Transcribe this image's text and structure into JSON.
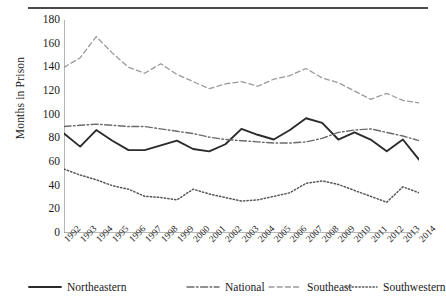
{
  "figure": {
    "ylabel": "Months in Prison",
    "rule": "top-horizontal-rule"
  },
  "legend": {
    "items": [
      {
        "label": "Northeastern",
        "style": "solid",
        "color": "#2b2b2b",
        "icon": "solid-line-swatch"
      },
      {
        "label": "National",
        "style": "dashdot",
        "color": "#6b6b6b",
        "icon": "dash-dot-line-swatch"
      },
      {
        "label": "Southeast",
        "style": "dashed",
        "color": "#9a9a9a",
        "icon": "dashed-line-swatch"
      },
      {
        "label": "Southwestern",
        "style": "dotted",
        "color": "#555555",
        "icon": "dotted-line-swatch"
      }
    ]
  },
  "chart_data": {
    "type": "line",
    "title": "",
    "xlabel": "",
    "ylabel": "Months in Prison",
    "xlim": [
      1992,
      2014
    ],
    "ylim": [
      0,
      180
    ],
    "ytick_step": 20,
    "grid": false,
    "legend_position": "bottom",
    "x": [
      1992,
      1993,
      1994,
      1995,
      1996,
      1997,
      1998,
      1999,
      2000,
      2001,
      2002,
      2003,
      2004,
      2005,
      2006,
      2007,
      2008,
      2009,
      2010,
      2011,
      2012,
      2013,
      2014
    ],
    "yticks": [
      0,
      20,
      40,
      60,
      80,
      100,
      120,
      140,
      160,
      180
    ],
    "categories": [
      "1992",
      "1993",
      "1994",
      "1995",
      "1996",
      "1997",
      "1998",
      "1999",
      "2000",
      "2001",
      "2002",
      "2003",
      "2004",
      "2005",
      "2006",
      "2007",
      "2008",
      "2009",
      "2010",
      "2011",
      "2012",
      "2013",
      "2014"
    ],
    "series": [
      {
        "name": "Northeastern",
        "style": "solid",
        "color": "#2b2b2b",
        "values": [
          84,
          73,
          87,
          78,
          70,
          70,
          74,
          78,
          71,
          69,
          75,
          88,
          83,
          79,
          87,
          97,
          93,
          79,
          85,
          79,
          69,
          79,
          62
        ]
      },
      {
        "name": "National",
        "style": "dashdot",
        "color": "#6b6b6b",
        "values": [
          90,
          91,
          92,
          91,
          90,
          90,
          88,
          86,
          84,
          81,
          79,
          78,
          77,
          76,
          76,
          77,
          80,
          85,
          87,
          88,
          85,
          82,
          78
        ]
      },
      {
        "name": "Southeast",
        "style": "dashed",
        "color": "#9a9a9a",
        "values": [
          140,
          148,
          166,
          152,
          140,
          135,
          143,
          134,
          128,
          122,
          126,
          128,
          124,
          130,
          133,
          139,
          131,
          127,
          120,
          113,
          118,
          112,
          110
        ]
      },
      {
        "name": "Southwestern",
        "style": "dotted",
        "color": "#555555",
        "values": [
          54,
          49,
          45,
          40,
          37,
          31,
          30,
          28,
          37,
          33,
          30,
          27,
          28,
          31,
          34,
          42,
          44,
          41,
          36,
          31,
          26,
          39,
          34
        ]
      }
    ]
  }
}
